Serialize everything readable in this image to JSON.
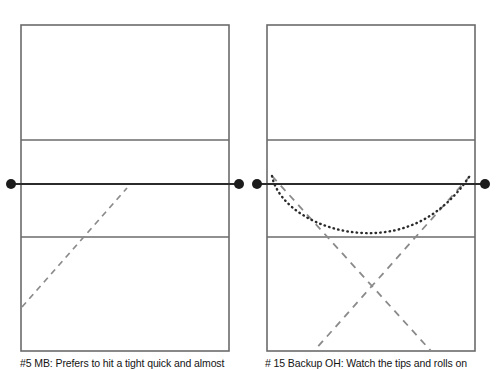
{
  "page": {
    "background_color": "#ffffff",
    "width": 496,
    "height": 370
  },
  "style": {
    "court_line_color": "#6b6b6b",
    "net_line_color": "#2b2b2b",
    "antenna_dot_color": "#1c1c1c",
    "dashed_path_color": "#8a8a8a",
    "dotted_path_color": "#2a2a2a",
    "caption_color": "#141414"
  },
  "panels": [
    {
      "id": "left-panel",
      "court": {
        "name": "volleyball-court-left",
        "x": 21,
        "y": 25,
        "width": 208,
        "height": 326,
        "lines": {
          "top_attack_line_y": 140,
          "net_line_y": 184,
          "bottom_attack_line_y": 237
        },
        "net": {
          "label": "net",
          "left_antenna": {
            "cx": 11,
            "cy": 184,
            "r": 5
          },
          "right_antenna": {
            "cx": 239,
            "cy": 184,
            "r": 5
          }
        }
      },
      "paths": [
        {
          "name": "attack-path-dashed",
          "style": "dashed",
          "kind": "line",
          "points": "22,307 127,188"
        }
      ],
      "caption": "#5 MB: Prefers to hit a tight quick and almost"
    },
    {
      "id": "right-panel",
      "court": {
        "name": "volleyball-court-right",
        "x": 19,
        "y": 25,
        "width": 208,
        "height": 326,
        "lines": {
          "top_attack_line_y": 140,
          "net_line_y": 184,
          "bottom_attack_line_y": 237
        },
        "net": {
          "label": "net",
          "left_antenna": {
            "cx": 9,
            "cy": 184,
            "r": 5
          },
          "right_antenna": {
            "cx": 237,
            "cy": 184,
            "r": 5
          }
        }
      },
      "paths": [
        {
          "name": "tip-roll-path-dotted",
          "style": "dotted",
          "kind": "curve",
          "description": "arcing tip/roll trajectory dipping to mid-court then rising to right antenna",
          "d": "M 24,176 C 30,206 70,231 115,233 C 160,235 196,214 221,177"
        },
        {
          "name": "attack-path-dashed-left-to-right",
          "style": "dashed",
          "kind": "line",
          "points": "24,176 183,351"
        },
        {
          "name": "attack-path-dashed-right-to-left",
          "style": "dashed",
          "kind": "line",
          "points": "222,176 66,351"
        }
      ],
      "caption": "# 15 Backup OH: Watch the tips and rolls on"
    }
  ]
}
